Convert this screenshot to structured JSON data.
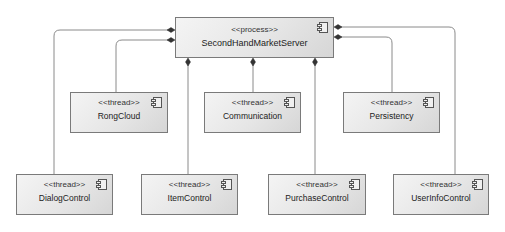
{
  "diagram": {
    "type": "UML component/process diagram",
    "server": {
      "stereotype": "<<process>>",
      "name": "SecondHandMarketServer"
    },
    "components": [
      {
        "stereotype": "<<thread>>",
        "name": "RongCloud"
      },
      {
        "stereotype": "<<thread>>",
        "name": "Communication"
      },
      {
        "stereotype": "<<thread>>",
        "name": "Persistency"
      },
      {
        "stereotype": "<<thread>>",
        "name": "DialogControl"
      },
      {
        "stereotype": "<<thread>>",
        "name": "ItemControl"
      },
      {
        "stereotype": "<<thread>>",
        "name": "PurchaseControl"
      },
      {
        "stereotype": "<<thread>>",
        "name": "UserInfoControl"
      }
    ],
    "relationships": [
      {
        "from": "SecondHandMarketServer",
        "to": "DialogControl",
        "kind": "composition"
      },
      {
        "from": "SecondHandMarketServer",
        "to": "RongCloud",
        "kind": "composition"
      },
      {
        "from": "SecondHandMarketServer",
        "to": "ItemControl",
        "kind": "composition"
      },
      {
        "from": "SecondHandMarketServer",
        "to": "Communication",
        "kind": "composition"
      },
      {
        "from": "SecondHandMarketServer",
        "to": "PurchaseControl",
        "kind": "composition"
      },
      {
        "from": "SecondHandMarketServer",
        "to": "Persistency",
        "kind": "composition"
      },
      {
        "from": "SecondHandMarketServer",
        "to": "UserInfoControl",
        "kind": "composition"
      }
    ],
    "colors": {
      "line": "#8a8a8a",
      "diamond": "#333333",
      "node_border": "#7a7a7a",
      "node_fill": "#e6e6e6"
    }
  }
}
